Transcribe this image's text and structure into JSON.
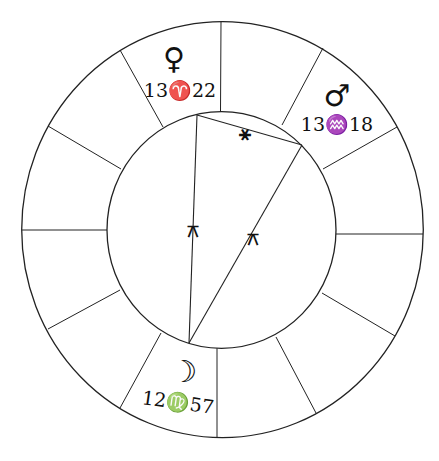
{
  "chart": {
    "type": "astrological-wheel",
    "houses": 12,
    "planets": [
      {
        "name": "Venus",
        "icon": "venus-icon",
        "glyph": "♀",
        "position": "13♈22",
        "degree": "13",
        "sign": "♈",
        "sign_name": "Aries",
        "minutes": "22"
      },
      {
        "name": "Mars",
        "icon": "mars-icon",
        "glyph": "♂",
        "position": "13♒18",
        "degree": "13",
        "sign": "♒",
        "sign_name": "Aquarius",
        "minutes": "18"
      },
      {
        "name": "Moon",
        "icon": "moon-icon",
        "glyph": "☽",
        "position": "12♍57",
        "degree": "12",
        "sign": "♍",
        "sign_name": "Virgo",
        "minutes": "57"
      }
    ],
    "aspects": [
      {
        "from": "Venus",
        "to": "Mars",
        "type": "sextile",
        "glyph": "⚹"
      },
      {
        "from": "Venus",
        "to": "Moon",
        "type": "quincunx",
        "glyph": "⚻"
      },
      {
        "from": "Mars",
        "to": "Moon",
        "type": "quincunx",
        "glyph": "⚻"
      }
    ]
  }
}
